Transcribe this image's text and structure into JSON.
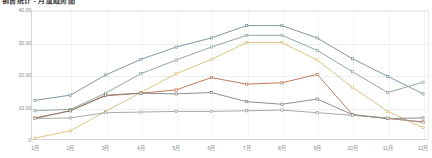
{
  "chart_title": "销售统计 - 月度趋势图",
  "axes": {
    "y_ticks": [
      "40.00",
      "30.00",
      "20.00",
      "10.00",
      "0"
    ],
    "y_values": [
      40,
      30,
      20,
      10,
      0
    ],
    "x_ticks": [
      "1月",
      "2月",
      "3月",
      "4月",
      "5月",
      "6月",
      "7月",
      "8月",
      "9月",
      "10月",
      "11月",
      "12月"
    ]
  },
  "colors": {
    "series_1": "#6b8394",
    "series_2": "#7e9c84",
    "series_3": "#d8b96a",
    "series_4": "#b5653f",
    "series_5": "#7a7a7a",
    "series_6": "#9a9a92",
    "grid": "#efefef",
    "axis": "#d7d7d7",
    "tick_text": "#8a8a8a"
  },
  "chart_data": {
    "type": "line",
    "title": "销售统计 - 月度趋势图",
    "xlabel": "",
    "ylabel": "",
    "ylim": [
      0,
      40
    ],
    "grid": true,
    "legend": "none",
    "categories": [
      "1月",
      "2月",
      "3月",
      "4月",
      "5月",
      "6月",
      "7月",
      "8月",
      "9月",
      "10月",
      "11月",
      "12月"
    ],
    "series": [
      {
        "name": "系列1",
        "color": "#6b8394",
        "values": [
          12.2,
          13.8,
          20.0,
          24.8,
          28.6,
          31.4,
          35.2,
          35.2,
          31.4,
          25.0,
          19.6,
          14.2
        ]
      },
      {
        "name": "系列2",
        "color": "#7e9c84",
        "values": [
          9.0,
          9.4,
          14.4,
          20.4,
          24.6,
          28.6,
          32.2,
          32.2,
          27.6,
          21.0,
          14.6,
          17.8
        ]
      },
      {
        "name": "系列3",
        "color": "#d8b96a",
        "values": [
          0.6,
          2.8,
          8.8,
          14.6,
          20.4,
          24.8,
          30.0,
          30.0,
          24.6,
          16.2,
          8.8,
          3.8
        ]
      },
      {
        "name": "系列4",
        "color": "#b5653f",
        "values": [
          6.8,
          9.0,
          13.6,
          14.4,
          15.4,
          19.2,
          17.2,
          17.6,
          20.2,
          7.8,
          6.6,
          5.6
        ]
      },
      {
        "name": "系列5",
        "color": "#7a7a7a",
        "values": [
          6.6,
          9.0,
          13.8,
          14.4,
          14.2,
          14.6,
          11.8,
          11.0,
          12.6,
          7.8,
          6.6,
          6.8
        ]
      },
      {
        "name": "系列6",
        "color": "#9a9a92",
        "values": [
          6.6,
          6.8,
          8.4,
          8.6,
          8.8,
          8.8,
          9.0,
          9.2,
          8.4,
          7.6,
          6.8,
          5.4
        ]
      }
    ]
  }
}
